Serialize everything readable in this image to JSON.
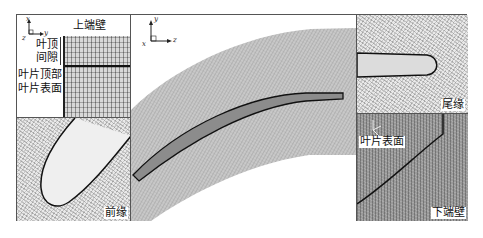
{
  "figure": {
    "panels": {
      "tip_gap": {
        "axes": {
          "vertical": "x",
          "horizontal": "y",
          "out_of_plane": "z"
        },
        "labels": {
          "upper_endwall": "上端壁",
          "tip_clearance_line1": "叶顶",
          "tip_clearance_line2": "间隙",
          "blade_tip": "叶片顶部",
          "blade_surface": "叶片表面"
        }
      },
      "leading_edge": {
        "label": "前缘"
      },
      "passage": {
        "axes": {
          "vertical": "y",
          "horizontal": "z",
          "out_of_plane": "x"
        }
      },
      "trailing_edge": {
        "label": "尾缘"
      },
      "lower_endwall": {
        "labels": {
          "blade_surface": "叶片表面",
          "lower_endwall": "下端壁"
        }
      }
    }
  },
  "colors": {
    "frame": "#555555",
    "mesh_light": "#e9e9e9",
    "mesh_medium": "#d8d8d8",
    "mesh_dark": "#9a9a9a",
    "blade_edge": "#111111"
  }
}
